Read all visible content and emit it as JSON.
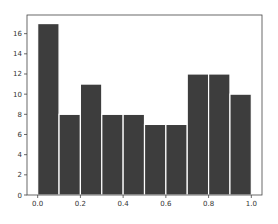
{
  "chart_data": {
    "type": "bar",
    "title": "",
    "xlabel": "",
    "ylabel": "",
    "bin_edges": [
      0.0,
      0.1,
      0.2,
      0.3,
      0.4,
      0.5,
      0.6,
      0.7,
      0.8,
      0.9,
      1.0
    ],
    "categories": [
      "0.0-0.1",
      "0.1-0.2",
      "0.2-0.3",
      "0.3-0.4",
      "0.4-0.5",
      "0.5-0.6",
      "0.6-0.7",
      "0.7-0.8",
      "0.8-0.9",
      "0.9-1.0"
    ],
    "values": [
      17,
      8,
      11,
      8,
      8,
      7,
      7,
      12,
      12,
      10
    ],
    "xlim": [
      -0.05,
      1.05
    ],
    "ylim": [
      0,
      17.85
    ],
    "x_ticks": [
      "0.0",
      "0.2",
      "0.4",
      "0.6",
      "0.8",
      "1.0"
    ],
    "y_ticks": [
      "0",
      "2",
      "4",
      "6",
      "8",
      "10",
      "12",
      "14",
      "16"
    ],
    "grid": false,
    "legend": null,
    "bar_color": "#3d3d3d",
    "edge_color": "#ffffff"
  }
}
